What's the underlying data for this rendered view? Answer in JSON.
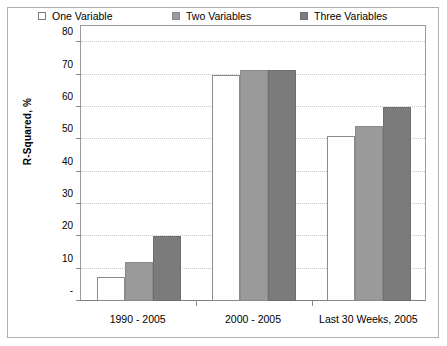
{
  "chart_data": {
    "type": "bar",
    "title": "",
    "xlabel": "",
    "ylabel": "R-Squared, %",
    "categories": [
      "1990 - 2005",
      "2000 - 2005",
      "Last 30 Weeks, 2005"
    ],
    "series": [
      {
        "name": "One Variable",
        "values": [
          7.5,
          70.0,
          51.0
        ],
        "color": "#ffffff"
      },
      {
        "name": "Two Variables",
        "values": [
          12.0,
          71.5,
          54.0
        ],
        "color": "#9a9a9a"
      },
      {
        "name": "Three Variables",
        "values": [
          20.0,
          71.5,
          60.0
        ],
        "color": "#7b7b7b"
      }
    ],
    "ylim": [
      0,
      85
    ],
    "yticks": [
      0,
      10,
      20,
      30,
      40,
      50,
      60,
      70,
      80
    ],
    "ytick_labels": [
      "-",
      "10",
      "20",
      "30",
      "40",
      "50",
      "60",
      "70",
      "80"
    ],
    "grid": true,
    "gridlines_axis": "y",
    "legend_position": "top-inside",
    "legend": [
      "One Variable",
      "Two Variables",
      "Three Variables"
    ]
  },
  "axes": {
    "y_title": "R-Squared, %"
  }
}
